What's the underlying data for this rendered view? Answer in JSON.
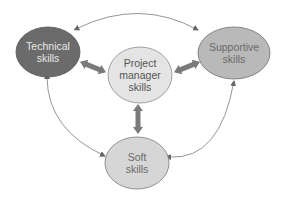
{
  "diagram": {
    "title": "",
    "nodes": [
      {
        "id": "technical",
        "label": "Technical\nskills",
        "cx": 48,
        "cy": 52,
        "rx": 32,
        "ry": 25,
        "fill": "#6b6b6b",
        "text_color": "#e8e8e8"
      },
      {
        "id": "supportive",
        "label": "Supportive\nskills",
        "cx": 234,
        "cy": 53,
        "rx": 36,
        "ry": 26,
        "fill": "#b9b9b9",
        "text_color": "#6a6a6a"
      },
      {
        "id": "project_manager",
        "label": "Project\nmanager\nskills",
        "cx": 140,
        "cy": 75,
        "rx": 32,
        "ry": 28,
        "fill": "#e4e4e4",
        "text_color": "#555555"
      },
      {
        "id": "soft",
        "label": "Soft\nskills",
        "cx": 137,
        "cy": 163,
        "rx": 32,
        "ry": 26,
        "fill": "#d6d6d6",
        "text_color": "#6a6a6a"
      }
    ],
    "edges": [
      {
        "from": "technical",
        "to": "supportive",
        "style": "thin-curved",
        "bidirectional": true
      },
      {
        "from": "technical",
        "to": "soft",
        "style": "thin-curved",
        "bidirectional": true
      },
      {
        "from": "supportive",
        "to": "soft",
        "style": "thin-curved",
        "bidirectional": false
      },
      {
        "from": "technical",
        "to": "project_manager",
        "style": "thick",
        "bidirectional": true
      },
      {
        "from": "supportive",
        "to": "project_manager",
        "style": "thick",
        "bidirectional": true
      },
      {
        "from": "project_manager",
        "to": "soft",
        "style": "thick",
        "bidirectional": true
      }
    ],
    "colors": {
      "thin_line": "#8a8a8a",
      "thick_arrow": "#7a7a7a",
      "outline": "#777777"
    }
  },
  "labels": {
    "technical": "Technical\nskills",
    "supportive": "Supportive\nskills",
    "project_manager": "Project\nmanager\nskills",
    "soft": "Soft\nskills"
  }
}
